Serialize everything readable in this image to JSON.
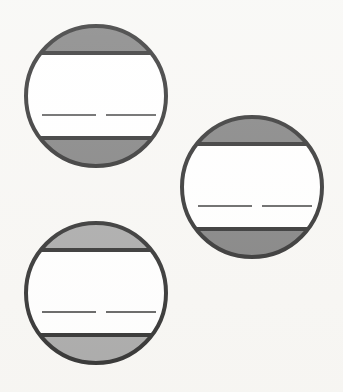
{
  "figure": {
    "background_color": "#f7f6f3",
    "outline_color": "#101010",
    "band_fill_color": "#ffffff",
    "outline_width": 4,
    "canvas": {
      "width": 343,
      "height": 392
    }
  },
  "palette": {
    "shade_dark": "#6d6d6d",
    "shade_light": "#9c9c9c",
    "white": "#ffffff",
    "ink": "#101010",
    "rule": "#4a4a4a"
  },
  "shapes": [
    {
      "id": "disc-top-left",
      "label": "Top-left disc",
      "center_x": 96,
      "center_y": 96,
      "radius": 70,
      "shade_color": "#6d6d6d",
      "top_band_y": 53,
      "bottom_band_y": 138,
      "rule_y": 115,
      "rule_left_start": 42,
      "rule_left_end": 96,
      "rule_right_start": 106,
      "rule_right_end": 156,
      "rule_width": 2
    },
    {
      "id": "disc-middle-right",
      "label": "Middle-right disc",
      "center_x": 252,
      "center_y": 187,
      "radius": 70,
      "shade_color": "#6d6d6d",
      "top_band_y": 144,
      "bottom_band_y": 229,
      "rule_y": 206,
      "rule_left_start": 198,
      "rule_left_end": 252,
      "rule_right_start": 262,
      "rule_right_end": 312,
      "rule_width": 2
    },
    {
      "id": "disc-bottom-left",
      "label": "Bottom-left disc",
      "center_x": 96,
      "center_y": 293,
      "radius": 70,
      "shade_color": "#9c9c9c",
      "top_band_y": 250,
      "bottom_band_y": 335,
      "rule_y": 312,
      "rule_left_start": 42,
      "rule_left_end": 96,
      "rule_right_start": 106,
      "rule_right_end": 156,
      "rule_width": 2
    }
  ]
}
